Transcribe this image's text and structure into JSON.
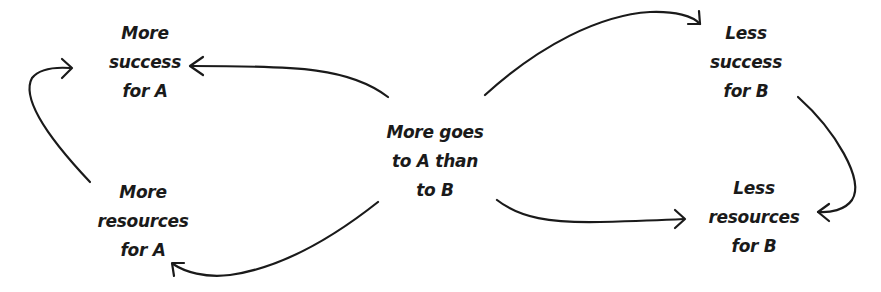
{
  "diagram": {
    "type": "causal-loop",
    "nodes": {
      "center": {
        "lines": [
          "More goes",
          "to A than",
          "to B"
        ]
      },
      "success_a": {
        "lines": [
          "More",
          "success",
          "for A"
        ]
      },
      "resources_a": {
        "lines": [
          "More",
          "resources",
          "for A"
        ]
      },
      "success_b": {
        "lines": [
          "Less",
          "success",
          "for B"
        ]
      },
      "resources_b": {
        "lines": [
          "Less",
          "resources",
          "for B"
        ]
      }
    },
    "edges": [
      {
        "from": "center",
        "to": "success_a"
      },
      {
        "from": "center",
        "to": "resources_b"
      },
      {
        "from": "center",
        "to": "success_b"
      },
      {
        "from": "center",
        "to": "resources_a"
      },
      {
        "from": "resources_a",
        "to": "success_a"
      },
      {
        "from": "success_b",
        "to": "resources_b"
      }
    ],
    "colors": {
      "ink": "#1a1a1a",
      "background": "#ffffff"
    }
  }
}
